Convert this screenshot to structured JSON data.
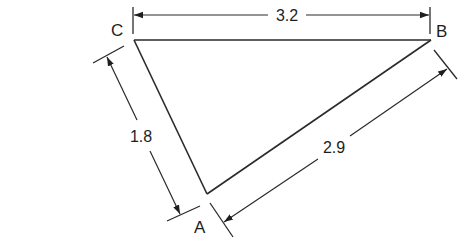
{
  "diagram": {
    "type": "triangle-dimension-drawing",
    "vertices": [
      {
        "id": "A",
        "label": "A"
      },
      {
        "id": "B",
        "label": "B"
      },
      {
        "id": "C",
        "label": "C"
      }
    ],
    "dimensions": [
      {
        "side": "CB",
        "label": "3.2"
      },
      {
        "side": "CA",
        "label": "1.8"
      },
      {
        "side": "AB",
        "label": "2.9"
      }
    ],
    "colors": {
      "line": "#2a2a2a",
      "text": "#1e1e1e",
      "background": "#ffffff"
    }
  }
}
